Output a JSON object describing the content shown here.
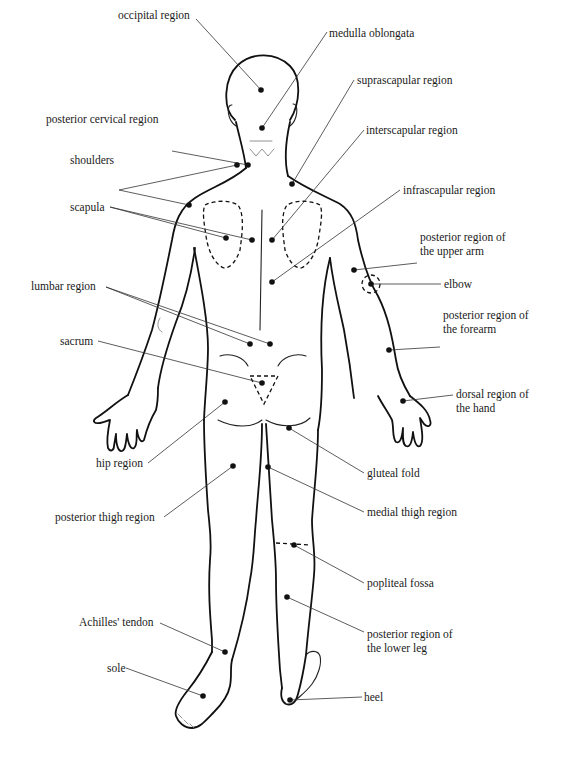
{
  "diagram": {
    "colors": {
      "line": "#111111",
      "background": "#ffffff",
      "leader": "#333333"
    },
    "labels": [
      {
        "id": "occipital-region",
        "text": "occipital region",
        "x": 118,
        "y": 8,
        "align": "left",
        "dots": [
          [
            261,
            90
          ]
        ],
        "anchor": [
          196,
          19
        ]
      },
      {
        "id": "medulla-oblongata",
        "text": "medulla oblongata",
        "x": 329,
        "y": 26,
        "align": "left",
        "dots": [
          [
            262,
            128
          ]
        ],
        "anchor": [
          327,
          32
        ]
      },
      {
        "id": "suprascapular-region",
        "text": "suprascapular region",
        "x": 357,
        "y": 73,
        "align": "left",
        "dots": [
          [
            292,
            184
          ]
        ],
        "anchor": [
          354,
          80
        ]
      },
      {
        "id": "posterior-cervical-region",
        "text": "posterior cervical region",
        "x": 46,
        "y": 112,
        "align": "left",
        "dots": [
          [
            248,
            165
          ]
        ],
        "anchor": [
          172,
          151
        ]
      },
      {
        "id": "interscapular-region",
        "text": "interscapular region",
        "x": 366,
        "y": 123,
        "align": "left",
        "dots": [
          [
            272,
            240
          ]
        ],
        "anchor": [
          364,
          130
        ]
      },
      {
        "id": "shoulders",
        "text": "shoulders",
        "x": 70,
        "y": 153,
        "align": "left",
        "dots": [
          [
            237,
            165
          ],
          [
            189,
            205
          ]
        ],
        "anchor": [
          119,
          190
        ]
      },
      {
        "id": "infrascapular-region",
        "text": "infrascapular region",
        "x": 403,
        "y": 183,
        "align": "left",
        "dots": [
          [
            272,
            282
          ]
        ],
        "anchor": [
          400,
          190
        ]
      },
      {
        "id": "scapula",
        "text": "scapula",
        "x": 70,
        "y": 200,
        "align": "left",
        "dots": [
          [
            226,
            238
          ],
          [
            252,
            240
          ]
        ],
        "anchor": [
          110,
          207
        ]
      },
      {
        "id": "posterior-region-of-upper-arm",
        "text": [
          "posterior region of",
          "the upper arm"
        ],
        "x": 420,
        "y": 230,
        "align": "left",
        "dots": [
          [
            354,
            270
          ]
        ],
        "anchor": [
          417,
          263
        ]
      },
      {
        "id": "elbow",
        "text": "elbow",
        "x": 444,
        "y": 277,
        "align": "left",
        "dots": [
          [
            371,
            284
          ]
        ],
        "anchor": [
          441,
          284
        ]
      },
      {
        "id": "lumbar-region",
        "text": "lumbar region",
        "x": 31,
        "y": 279,
        "align": "left",
        "dots": [
          [
            250,
            344
          ],
          [
            270,
            344
          ]
        ],
        "anchor": [
          106,
          287
        ]
      },
      {
        "id": "posterior-region-of-forearm",
        "text": [
          "posterior region of",
          "the forearm"
        ],
        "x": 443,
        "y": 308,
        "align": "left",
        "dots": [
          [
            389,
            350
          ]
        ],
        "anchor": [
          440,
          347
        ]
      },
      {
        "id": "sacrum",
        "text": "sacrum",
        "x": 60,
        "y": 334,
        "align": "left",
        "dots": [
          [
            262,
            383
          ]
        ],
        "anchor": [
          98,
          341
        ]
      },
      {
        "id": "dorsal-region-of-hand",
        "text": [
          "dorsal region of",
          "the hand"
        ],
        "x": 456,
        "y": 387,
        "align": "left",
        "dots": [
          [
            403,
            401
          ]
        ],
        "anchor": [
          453,
          395
        ]
      },
      {
        "id": "hip-region",
        "text": "hip region",
        "x": 96,
        "y": 456,
        "align": "left",
        "dots": [
          [
            225,
            402
          ]
        ],
        "anchor": [
          148,
          463
        ]
      },
      {
        "id": "gluteal-fold",
        "text": "gluteal fold",
        "x": 367,
        "y": 466,
        "align": "left",
        "dots": [
          [
            289,
            428
          ]
        ],
        "anchor": [
          364,
          473
        ]
      },
      {
        "id": "posterior-thigh-region",
        "text": "posterior thigh region",
        "x": 55,
        "y": 510,
        "align": "left",
        "dots": [
          [
            233,
            466
          ]
        ],
        "anchor": [
          164,
          517
        ]
      },
      {
        "id": "medial-thigh-region",
        "text": "medial thigh region",
        "x": 367,
        "y": 505,
        "align": "left",
        "dots": [
          [
            268,
            467
          ]
        ],
        "anchor": [
          364,
          512
        ]
      },
      {
        "id": "popliteal-fossa",
        "text": "popliteal fossa",
        "x": 367,
        "y": 576,
        "align": "left",
        "dots": [
          [
            294,
            545
          ]
        ],
        "anchor": [
          364,
          583
        ]
      },
      {
        "id": "posterior-region-of-lower-leg",
        "text": [
          "posterior region of",
          "the lower leg"
        ],
        "x": 367,
        "y": 627,
        "align": "left",
        "dots": [
          [
            287,
            597
          ]
        ],
        "anchor": [
          364,
          632
        ]
      },
      {
        "id": "achilles-tendon",
        "text": "Achilles' tendon",
        "x": 79,
        "y": 615,
        "align": "left",
        "dots": [
          [
            225,
            652
          ]
        ],
        "anchor": [
          160,
          623
        ]
      },
      {
        "id": "sole",
        "text": "sole",
        "x": 107,
        "y": 661,
        "align": "left",
        "dots": [
          [
            203,
            696
          ]
        ],
        "anchor": [
          126,
          668
        ]
      },
      {
        "id": "heel",
        "text": "heel",
        "x": 364,
        "y": 690,
        "align": "left",
        "dots": [
          [
            290,
            700
          ]
        ],
        "anchor": [
          362,
          697
        ]
      }
    ]
  }
}
